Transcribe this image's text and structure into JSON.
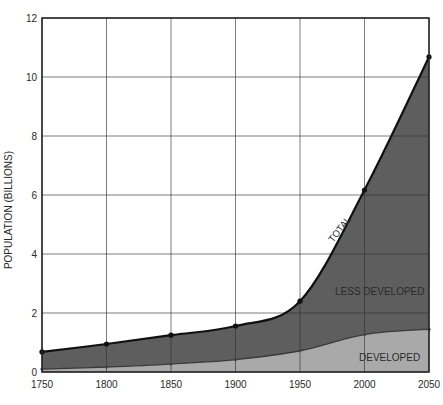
{
  "chart_data": {
    "type": "area",
    "title": "",
    "xlabel": "",
    "ylabel": "POPULATION (BILLIONS)",
    "x": [
      1750,
      1800,
      1850,
      1900,
      1950,
      2000,
      2050
    ],
    "xticks": [
      "1750",
      "1800",
      "1850",
      "1900",
      "1950",
      "2000",
      "2050"
    ],
    "yticks": [
      "0",
      "2",
      "4",
      "6",
      "8",
      "10",
      "12"
    ],
    "ylim": [
      0,
      12
    ],
    "xlim": [
      1750,
      2050
    ],
    "grid": true,
    "stacked": true,
    "series": [
      {
        "name": "DEVELOPED",
        "values": [
          0.1,
          0.17,
          0.27,
          0.42,
          0.72,
          1.27,
          1.45
        ],
        "color": "#a9a9a9"
      },
      {
        "name": "LESS DEVELOPED",
        "values": [
          0.58,
          0.78,
          0.98,
          1.14,
          1.68,
          4.9,
          9.23
        ],
        "color": "#5e5e5e"
      }
    ],
    "total": {
      "name": "TOTAL",
      "values": [
        0.68,
        0.95,
        1.25,
        1.56,
        2.4,
        6.17,
        10.68
      ]
    },
    "annotations": [
      "TOTAL",
      "LESS DEVELOPED",
      "DEVELOPED"
    ]
  }
}
